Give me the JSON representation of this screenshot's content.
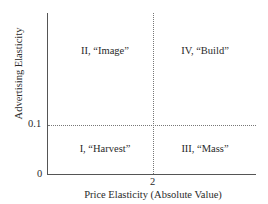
{
  "diagram": {
    "type": "quadrant",
    "x_axis": {
      "label": "Price Elasticity (Absolute Value)",
      "threshold_tick": "2",
      "origin_tick": "0"
    },
    "y_axis": {
      "label": "Advertising Elasticity",
      "threshold_tick": "0.1"
    },
    "quadrants": {
      "top_left": "II, “Image”",
      "top_right": "IV, “Build”",
      "bottom_left": "I, “Harvest”",
      "bottom_right": "III, “Mass”"
    }
  }
}
